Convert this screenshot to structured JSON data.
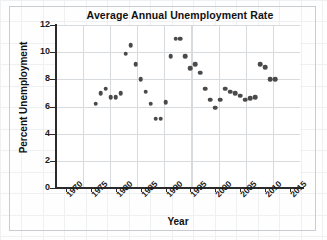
{
  "chart_data": {
    "type": "scatter",
    "title": "Average Annual Unemployment Rate",
    "xlabel": "Year",
    "ylabel": "Percent Unemployment",
    "xlim": [
      1968,
      2017
    ],
    "ylim": [
      0,
      12
    ],
    "xticks": [
      1970,
      1975,
      1980,
      1985,
      1990,
      1995,
      2000,
      2005,
      2010,
      2015
    ],
    "yticks": [
      0,
      2,
      4,
      6,
      8,
      10,
      12
    ],
    "grid": true,
    "legend": "none",
    "marker_color": "#4a4a4a",
    "x": [
      1976,
      1977,
      1978,
      1979,
      1980,
      1981,
      1982,
      1983,
      1984,
      1985,
      1986,
      1987,
      1988,
      1989,
      1990,
      1991,
      1992,
      1993,
      1994,
      1995,
      1996,
      1997,
      1998,
      1999,
      2000,
      2001,
      2002,
      2003,
      2004,
      2005,
      2006,
      2007,
      2008,
      2009,
      2010,
      2011,
      2012
    ],
    "y": [
      6.2,
      7.0,
      7.3,
      6.7,
      6.7,
      7.0,
      9.9,
      10.5,
      9.1,
      8.0,
      7.1,
      6.2,
      5.1,
      5.1,
      6.3,
      9.7,
      11.0,
      11.0,
      9.7,
      8.8,
      9.1,
      8.5,
      7.3,
      6.5,
      5.9,
      6.5,
      7.3,
      7.1,
      7.0,
      6.8,
      6.5,
      6.6,
      6.7,
      9.1,
      8.9,
      8.0,
      8.0
    ]
  },
  "axes": {
    "ytick_labels": [
      "12",
      "10",
      "8",
      "6",
      "4",
      "2",
      "0"
    ],
    "xtick_labels": [
      "1970",
      "1975",
      "1980",
      "1985",
      "1990",
      "1995",
      "2000",
      "2005",
      "2010",
      "2015"
    ]
  }
}
